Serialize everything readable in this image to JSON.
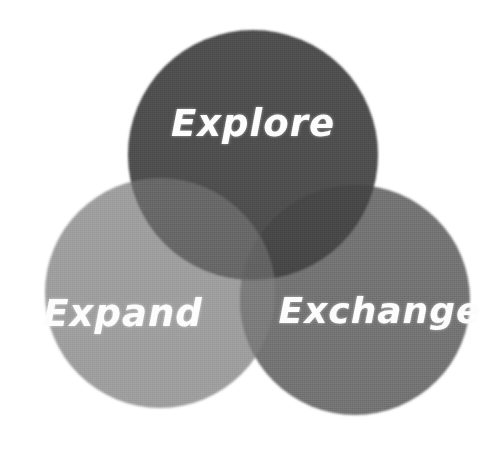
{
  "diagram": {
    "type": "venn",
    "title": "",
    "background_color": "#ffffff",
    "sets": [
      {
        "id": "explore",
        "label": "Explore",
        "color": "#555555",
        "position": "top",
        "center": {
          "x": 253,
          "y": 155
        },
        "radius": 125,
        "label_position": {
          "x": 253,
          "y": 125
        }
      },
      {
        "id": "expand",
        "label": "Expand",
        "color": "#a5a5a5",
        "position": "bottom-left",
        "center": {
          "x": 160,
          "y": 293
        },
        "radius": 115,
        "label_position": {
          "x": 123,
          "y": 315
        }
      },
      {
        "id": "exchange",
        "label": "Exchange",
        "color": "#7d7d7d",
        "position": "bottom-right",
        "center": {
          "x": 355,
          "y": 300
        },
        "radius": 115,
        "label_position": {
          "x": 380,
          "y": 313
        }
      }
    ],
    "overlap_colors": {
      "explore_expand": "#6f6f6f",
      "explore_exchange": "#4d4d4d",
      "expand_exchange": "#858585",
      "all_three": "#6a6a6a"
    },
    "label_color": "#fdfdfd"
  }
}
